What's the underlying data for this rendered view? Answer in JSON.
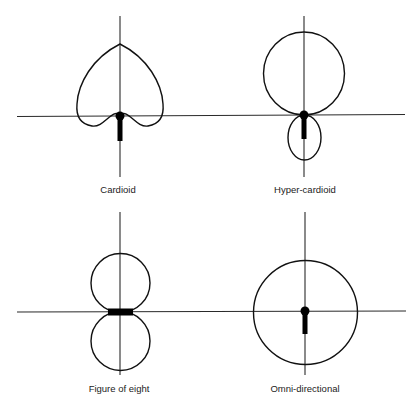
{
  "figure": {
    "type": "microphone polar patterns",
    "panels": [
      {
        "id": "cardioid",
        "label": "Cardioid",
        "pattern_shape": "heart-shaped single lobe pointing up, small notch at rear"
      },
      {
        "id": "hyper-cardioid",
        "label": "Hyper-cardioid",
        "pattern_shape": "large front lobe above axis with small rear lobe below"
      },
      {
        "id": "figure-of-eight",
        "label": "Figure of eight",
        "pattern_shape": "two equal circular lobes above and below axis"
      },
      {
        "id": "omni-directional",
        "label": "Omni-directional",
        "pattern_shape": "single circle centered on microphone"
      }
    ],
    "colors": {
      "background": "#ffffff",
      "line": "#111111",
      "axis": "#2a2a2a"
    }
  }
}
